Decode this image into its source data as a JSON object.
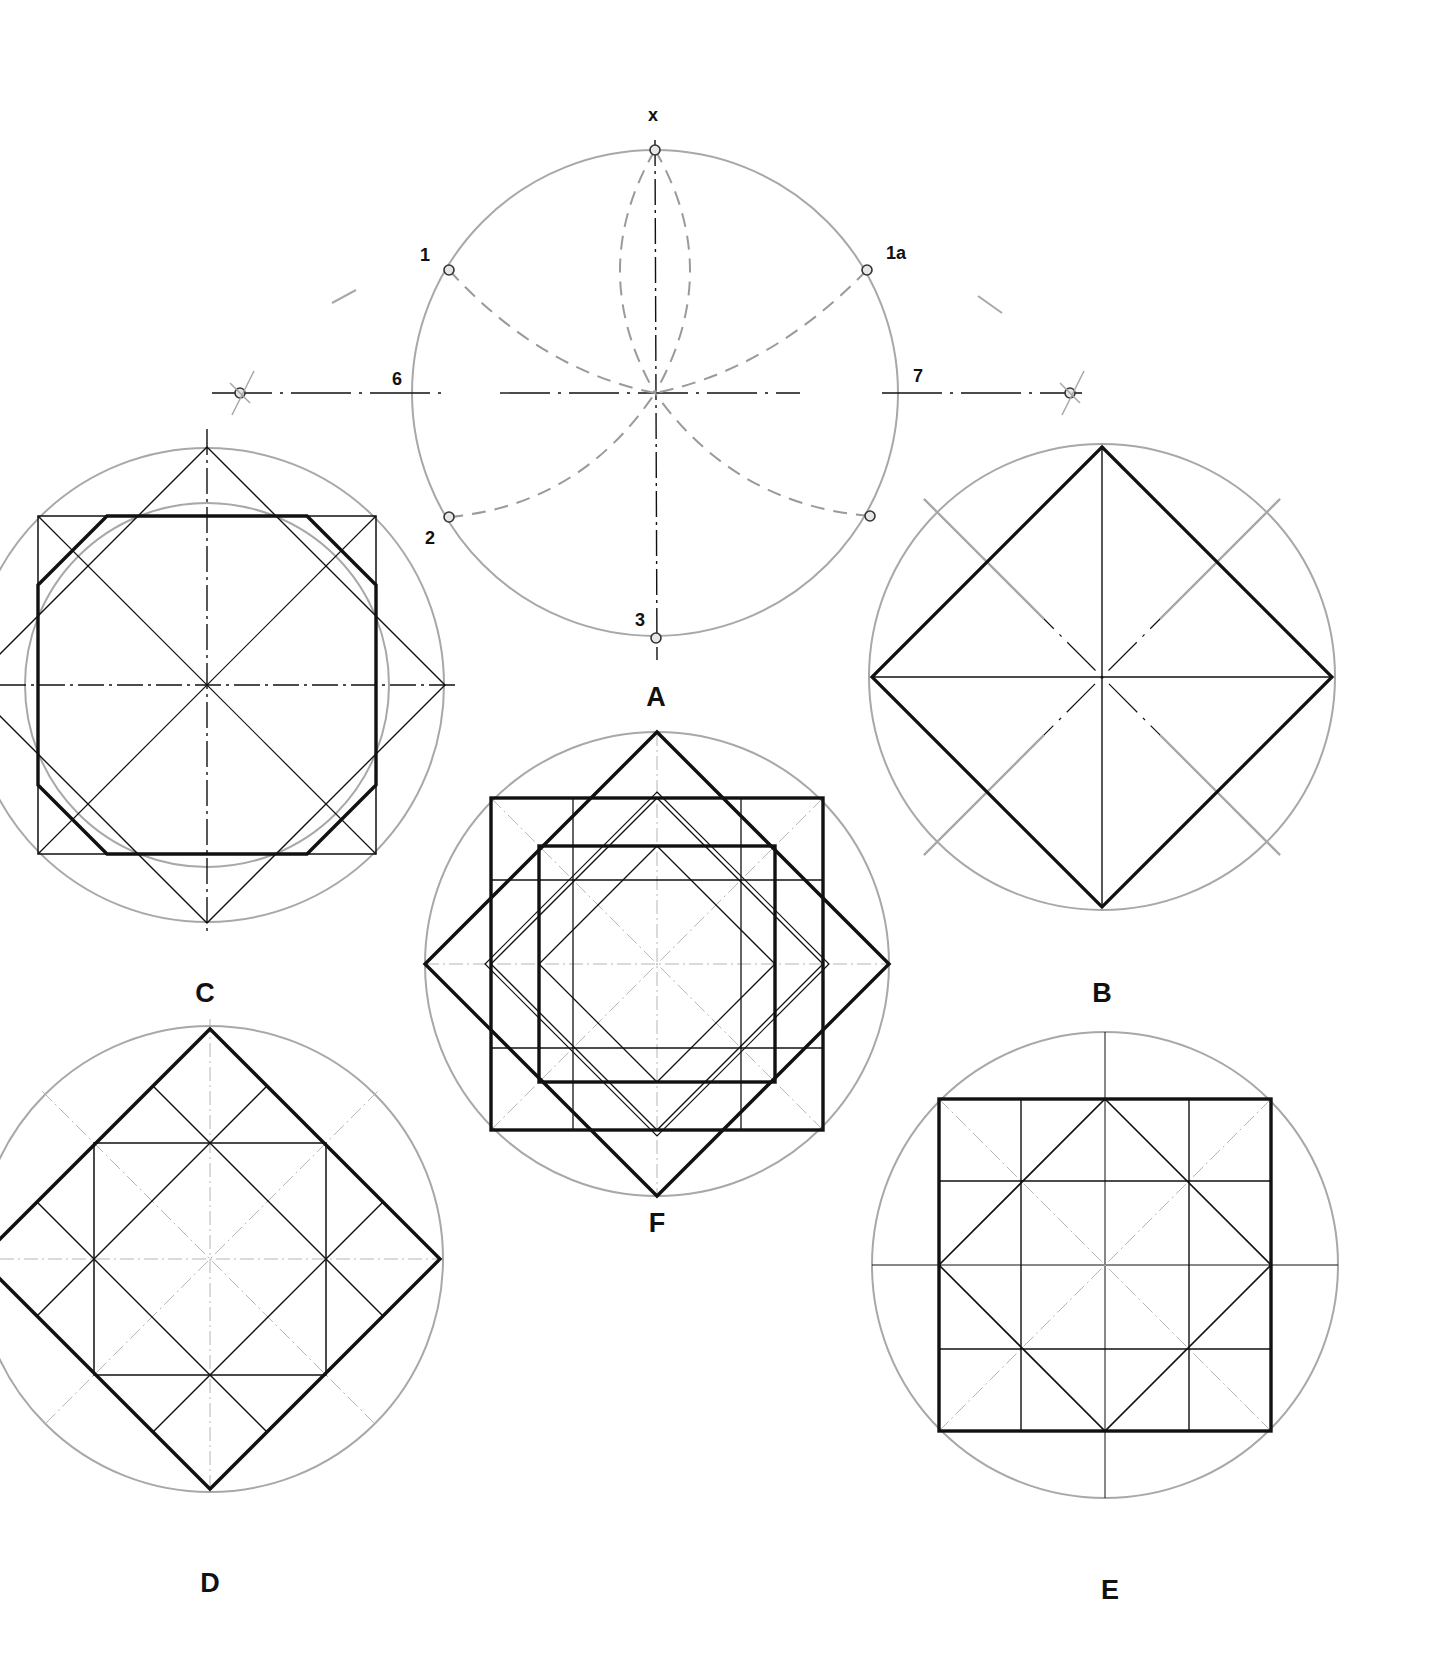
{
  "colors": {
    "background": "#ffffff",
    "ink": "#111111",
    "construction_gray": "#a8a8a8",
    "dash_gray": "#9a9a9a",
    "faint_axis": "#b5b5b5"
  },
  "figures": {
    "A": {
      "label": "A",
      "cx": 655,
      "cy": 393,
      "r": 243,
      "label_x": 656,
      "label_y": 697,
      "point_labels": [
        {
          "id": "x",
          "text": "x",
          "x": 653,
          "y": 115
        },
        {
          "id": "1",
          "text": "1",
          "x": 425,
          "y": 255
        },
        {
          "id": "1a",
          "text": "1a",
          "x": 896,
          "y": 253
        },
        {
          "id": "6",
          "text": "6",
          "x": 397,
          "y": 379
        },
        {
          "id": "7",
          "text": "7",
          "x": 918,
          "y": 376
        },
        {
          "id": "2",
          "text": "2",
          "x": 430,
          "y": 538
        },
        {
          "id": "3",
          "text": "3",
          "x": 640,
          "y": 620
        }
      ],
      "points": [
        {
          "id": "x",
          "x": 655,
          "y": 150
        },
        {
          "id": "1",
          "x": 449,
          "y": 270
        },
        {
          "id": "1a",
          "x": 867,
          "y": 270
        },
        {
          "id": "2",
          "x": 449,
          "y": 517
        },
        {
          "id": "2a",
          "x": 870,
          "y": 516
        },
        {
          "id": "3",
          "x": 656,
          "y": 638
        },
        {
          "id": "6-ext",
          "x": 240,
          "y": 393
        },
        {
          "id": "7-ext",
          "x": 1070,
          "y": 393
        }
      ]
    },
    "B": {
      "label": "B",
      "cx": 1102,
      "cy": 677,
      "r": 233,
      "diamond": 230,
      "label_x": 1102,
      "label_y": 993
    },
    "C": {
      "label": "C",
      "cx": 207,
      "cy": 685,
      "r_outer": 237,
      "r_inner": 182,
      "square_half": 169,
      "diamond": 238,
      "label_x": 205,
      "label_y": 993
    },
    "D": {
      "label": "D",
      "cx": 210,
      "cy": 1259,
      "r": 233,
      "diamond": 230,
      "inner_half": 116,
      "label_x": 210,
      "label_y": 1583
    },
    "E": {
      "label": "E",
      "cx": 1105,
      "cy": 1265,
      "r": 233,
      "square_half": 166,
      "grid": 84,
      "label_x": 1110,
      "label_y": 1590
    },
    "F": {
      "label": "F",
      "cx": 657,
      "cy": 964,
      "r": 232,
      "diamond": 232,
      "outer_half": 166,
      "inner_half": 118,
      "grid": 84,
      "label_x": 657,
      "label_y": 1223
    }
  }
}
